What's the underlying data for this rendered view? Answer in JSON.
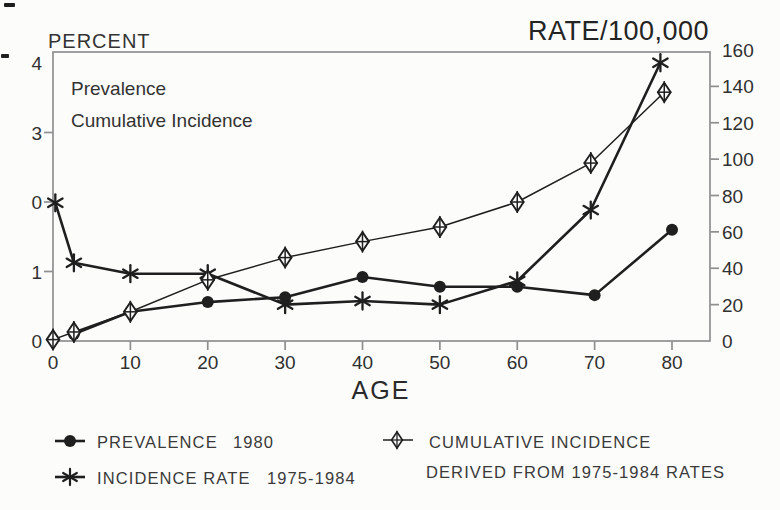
{
  "titles": {
    "left_axis": "PERCENT",
    "right_axis": "RATE/100,000",
    "x_axis": "AGE"
  },
  "inner_labels": {
    "line1": "Prevalence",
    "line2": "Cumulative Incidence"
  },
  "axes": {
    "left_percent": {
      "ticks": [
        {
          "value": 4,
          "label": "4"
        },
        {
          "value": 3,
          "label": "3"
        },
        {
          "value": 2,
          "label": "0"
        },
        {
          "value": 1,
          "label": "1"
        },
        {
          "value": 0,
          "label": "0"
        }
      ]
    },
    "right_rate": {
      "ticks": [
        {
          "value": 160,
          "label": "160"
        },
        {
          "value": 140,
          "label": "140"
        },
        {
          "value": 120,
          "label": "120"
        },
        {
          "value": 100,
          "label": "100"
        },
        {
          "value": 80,
          "label": "80"
        },
        {
          "value": 60,
          "label": "60"
        },
        {
          "value": 40,
          "label": "40"
        },
        {
          "value": 20,
          "label": "20"
        },
        {
          "value": 0,
          "label": "0"
        }
      ]
    },
    "bottom_age": {
      "ticks": [
        {
          "value": 0,
          "label": "0"
        },
        {
          "value": 10,
          "label": "10"
        },
        {
          "value": 20,
          "label": "20"
        },
        {
          "value": 30,
          "label": "30"
        },
        {
          "value": 40,
          "label": "40"
        },
        {
          "value": 50,
          "label": "50"
        },
        {
          "value": 60,
          "label": "60"
        },
        {
          "value": 70,
          "label": "70"
        },
        {
          "value": 80,
          "label": "80"
        }
      ]
    }
  },
  "legend": [
    {
      "marker": "filled-circle",
      "label": "PREVALENCE",
      "period": "1980"
    },
    {
      "marker": "star",
      "label": "INCIDENCE RATE",
      "period": "1975-1984"
    },
    {
      "marker": "diamond-cross",
      "label": "CUMULATIVE INCIDENCE",
      "label2": "DERIVED FROM 1975-1984 RATES"
    }
  ],
  "colors": {
    "ink": "#1f1f1f",
    "frame": "#8f8f8f",
    "background": "#fcfcfa"
  },
  "chart_data": {
    "type": "line",
    "title": "",
    "xlabel": "AGE",
    "ylabel_left": "PERCENT",
    "ylabel_right": "RATE/100,000",
    "xlim": [
      0,
      85
    ],
    "ylim_left": [
      0,
      4
    ],
    "ylim_right": [
      0,
      160
    ],
    "grid": false,
    "legend_position": "bottom",
    "series": [
      {
        "name": "PREVALENCE 1980",
        "axis": "left",
        "units": "percent",
        "marker": "filled-circle",
        "x": [
          2.7,
          10,
          20,
          30,
          40,
          50,
          60,
          70,
          80
        ],
        "y": [
          0.1,
          0.42,
          0.56,
          0.63,
          0.92,
          0.78,
          0.78,
          0.66,
          1.6
        ]
      },
      {
        "name": "INCIDENCE RATE 1975-1984",
        "axis": "right",
        "units": "rate per 100,000",
        "marker": "star",
        "x": [
          0.3,
          2.7,
          10,
          20,
          30,
          40,
          50,
          60,
          69.5,
          78.5
        ],
        "y": [
          76,
          43,
          37,
          37,
          20,
          22,
          20,
          33,
          72,
          153
        ]
      },
      {
        "name": "CUMULATIVE INCIDENCE DERIVED FROM 1975-1984 RATES",
        "axis": "left",
        "units": "percent",
        "marker": "diamond-cross",
        "x": [
          0,
          2.7,
          10,
          20,
          30,
          40,
          50,
          60,
          69.5,
          79
        ],
        "y": [
          0.02,
          0.13,
          0.42,
          0.88,
          1.2,
          1.43,
          1.64,
          2.0,
          2.56,
          3.58
        ]
      }
    ]
  }
}
